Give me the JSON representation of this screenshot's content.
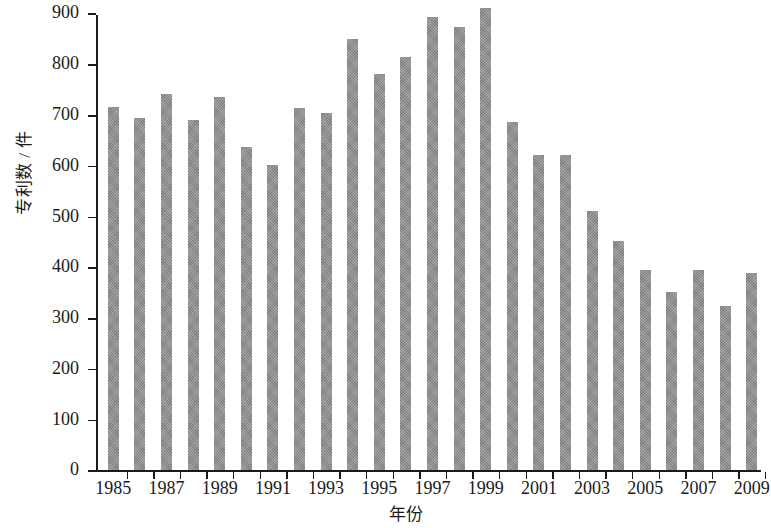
{
  "axes": {
    "y_title": "专利数 / 件",
    "x_title": "年份",
    "y_ticks": [
      "0",
      "100",
      "200",
      "300",
      "400",
      "500",
      "600",
      "700",
      "800",
      "900"
    ],
    "x_tick_labels": [
      "1985",
      "1987",
      "1989",
      "1991",
      "1993",
      "1995",
      "1997",
      "1999",
      "2001",
      "2003",
      "2005",
      "2007",
      "2009"
    ]
  },
  "style": {
    "bar_color": "#8d8d8d",
    "axis_color": "#1a1a1a",
    "background": "#ffffff"
  },
  "chart_data": {
    "type": "bar",
    "title": "",
    "subtitle": "",
    "xlabel": "年份",
    "ylabel": "专利数 / 件",
    "xlim": [
      1985,
      2009
    ],
    "ylim": [
      0,
      900
    ],
    "grid": false,
    "legend": false,
    "categories": [
      "1985",
      "1986",
      "1987",
      "1988",
      "1989",
      "1990",
      "1991",
      "1992",
      "1993",
      "1994",
      "1995",
      "1996",
      "1997",
      "1998",
      "1999",
      "2000",
      "2001",
      "2002",
      "2003",
      "2004",
      "2005",
      "2006",
      "2007",
      "2008",
      "2009"
    ],
    "values": [
      716,
      694,
      741,
      690,
      736,
      637,
      601,
      713,
      703,
      850,
      780,
      815,
      893,
      873,
      910,
      686,
      621,
      621,
      511,
      452,
      394,
      352,
      395,
      324,
      389
    ],
    "annotations": []
  }
}
